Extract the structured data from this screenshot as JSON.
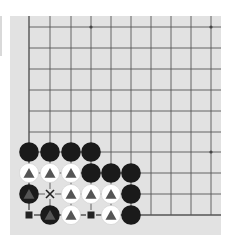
{
  "board": {
    "background": "#e2e2e2",
    "line_color": "#555555",
    "cols": 10,
    "rows": 10,
    "origin_x": 29,
    "origin_y": 27,
    "spacing_x": 20.2,
    "spacing_y": 20.9,
    "star_points": [
      [
        8,
        0
      ],
      [
        20,
        0
      ],
      [
        20,
        6
      ]
    ],
    "stones": [
      {
        "col": 0,
        "row": 6,
        "color": "black"
      },
      {
        "col": 1,
        "row": 6,
        "color": "black"
      },
      {
        "col": 2,
        "row": 6,
        "color": "black"
      },
      {
        "col": 3,
        "row": 6,
        "color": "black"
      },
      {
        "col": 0,
        "row": 7,
        "color": "white",
        "mark": "triangle"
      },
      {
        "col": 1,
        "row": 7,
        "color": "white",
        "mark": "triangle"
      },
      {
        "col": 2,
        "row": 7,
        "color": "white",
        "mark": "triangle"
      },
      {
        "col": 3,
        "row": 7,
        "color": "black"
      },
      {
        "col": 4,
        "row": 7,
        "color": "black"
      },
      {
        "col": 5,
        "row": 7,
        "color": "black"
      },
      {
        "col": 0,
        "row": 8,
        "color": "black",
        "mark": "triangle"
      },
      {
        "col": 2,
        "row": 8,
        "color": "white",
        "mark": "triangle"
      },
      {
        "col": 3,
        "row": 8,
        "color": "white",
        "mark": "triangle"
      },
      {
        "col": 4,
        "row": 8,
        "color": "white",
        "mark": "triangle"
      },
      {
        "col": 5,
        "row": 8,
        "color": "black"
      },
      {
        "col": 1,
        "row": 9,
        "color": "black",
        "mark": "triangle"
      },
      {
        "col": 2,
        "row": 9,
        "color": "white",
        "mark": "triangle"
      },
      {
        "col": 4,
        "row": 9,
        "color": "white",
        "mark": "triangle"
      },
      {
        "col": 5,
        "row": 9,
        "color": "black"
      }
    ],
    "empty_marks": [
      {
        "col": 1,
        "row": 8,
        "mark": "cross"
      },
      {
        "col": 0,
        "row": 9,
        "mark": "square"
      },
      {
        "col": 3,
        "row": 9,
        "mark": "square"
      }
    ]
  }
}
